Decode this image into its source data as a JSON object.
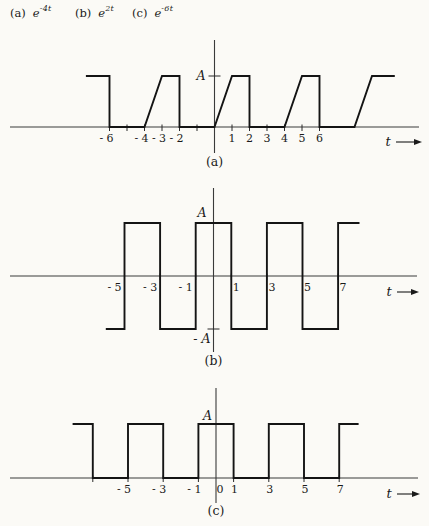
{
  "page": {
    "colors": {
      "ink": "#1a1a1a",
      "axis": "#3a3a3a",
      "paper": "#fbfaf6"
    }
  },
  "header": {
    "items": [
      {
        "label": "(a)",
        "base": "e",
        "exponent": "-4t"
      },
      {
        "label": "(b)",
        "base": "e",
        "exponent": "2t"
      },
      {
        "label": "(c)",
        "base": "e",
        "exponent": "-6t"
      }
    ]
  },
  "chart_data": [
    {
      "id": "a",
      "type": "line",
      "caption": "(a)",
      "xlabel": "t",
      "ylim": [
        0,
        1
      ],
      "xlim": [
        -11.7,
        11.7
      ],
      "points": [
        [
          -7.35,
          1
        ],
        [
          -6,
          1
        ],
        [
          -6,
          0
        ],
        [
          -4,
          0
        ],
        [
          -3,
          1
        ],
        [
          -2,
          1
        ],
        [
          -2,
          0
        ],
        [
          0,
          0
        ],
        [
          1,
          1
        ],
        [
          2,
          1
        ],
        [
          2,
          0
        ],
        [
          4,
          0
        ],
        [
          5,
          1
        ],
        [
          6,
          1
        ],
        [
          6,
          0
        ],
        [
          8,
          0
        ],
        [
          9,
          1
        ],
        [
          10.3,
          1
        ]
      ],
      "xticks": [
        {
          "t": -6,
          "label": "- 6"
        },
        {
          "t": -4,
          "label": "- 4"
        },
        {
          "t": -3,
          "label": "- 3"
        },
        {
          "t": -2,
          "label": "- 2"
        },
        {
          "t": 1,
          "label": "1"
        },
        {
          "t": 2,
          "label": "2"
        },
        {
          "t": 3,
          "label": "3"
        },
        {
          "t": 4,
          "label": "4"
        },
        {
          "t": 5,
          "label": "5"
        },
        {
          "t": 6,
          "label": "6"
        }
      ],
      "tick_marks": [
        -6,
        -5,
        -4,
        -3,
        -2,
        -1,
        1,
        2,
        3,
        4,
        5,
        6
      ],
      "yticks": [
        {
          "value": 1,
          "label": "A"
        }
      ]
    },
    {
      "id": "b",
      "type": "line",
      "caption": "(b)",
      "xlabel": "t",
      "ylim": [
        -1,
        1
      ],
      "xlim": [
        -11.5,
        11.5
      ],
      "points": [
        [
          -6.05,
          -1
        ],
        [
          -5,
          -1
        ],
        [
          -5,
          1
        ],
        [
          -3,
          1
        ],
        [
          -3,
          -1
        ],
        [
          -1,
          -1
        ],
        [
          -1,
          1
        ],
        [
          1,
          1
        ],
        [
          1,
          -1
        ],
        [
          3,
          -1
        ],
        [
          3,
          1
        ],
        [
          5,
          1
        ],
        [
          5,
          -1
        ],
        [
          7,
          -1
        ],
        [
          7,
          1
        ],
        [
          8.2,
          1
        ]
      ],
      "xticks": [
        {
          "t": -5,
          "label": "- 5"
        },
        {
          "t": -3,
          "label": "- 3"
        },
        {
          "t": -1,
          "label": "- 1"
        },
        {
          "t": 1,
          "label": "1"
        },
        {
          "t": 3,
          "label": "3"
        },
        {
          "t": 5,
          "label": "5"
        },
        {
          "t": 7,
          "label": "7"
        }
      ],
      "tick_marks": [
        -5,
        -3,
        -1,
        1,
        3,
        5,
        7
      ],
      "yticks": [
        {
          "value": 1,
          "label": "A"
        },
        {
          "value": -1,
          "label": "- A"
        }
      ]
    },
    {
      "id": "c",
      "type": "line",
      "caption": "(c)",
      "xlabel": "t",
      "ylim": [
        0,
        1
      ],
      "xlim": [
        -11.7,
        11.5
      ],
      "points": [
        [
          -8.15,
          1
        ],
        [
          -7,
          1
        ],
        [
          -7,
          0
        ],
        [
          -5,
          0
        ],
        [
          -5,
          1
        ],
        [
          -3,
          1
        ],
        [
          -3,
          0
        ],
        [
          -1,
          0
        ],
        [
          -1,
          1
        ],
        [
          1,
          1
        ],
        [
          1,
          0
        ],
        [
          3,
          0
        ],
        [
          3,
          1
        ],
        [
          5,
          1
        ],
        [
          5,
          0
        ],
        [
          7,
          0
        ],
        [
          7,
          1
        ],
        [
          8.1,
          1
        ]
      ],
      "xticks": [
        {
          "t": -5,
          "label": "- 5"
        },
        {
          "t": -3,
          "label": "- 3"
        },
        {
          "t": -1,
          "label": "- 1"
        },
        {
          "t": 0,
          "label": "0"
        },
        {
          "t": 1,
          "label": "1"
        },
        {
          "t": 3,
          "label": "3"
        },
        {
          "t": 5,
          "label": "5"
        },
        {
          "t": 7,
          "label": "7"
        }
      ],
      "tick_marks": [
        -7,
        -5,
        -3,
        -1,
        1,
        3,
        5,
        7
      ],
      "yticks": [
        {
          "value": 1,
          "label": "A"
        }
      ]
    }
  ]
}
